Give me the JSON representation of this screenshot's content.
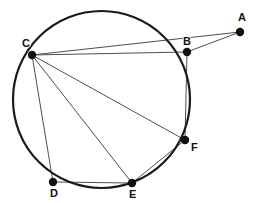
{
  "figure": {
    "width": 257,
    "height": 203,
    "background_color": "#ffffff",
    "stroke_color": "#3a3a3a",
    "circle_color": "#1a1a1a",
    "point_color": "#111111",
    "label_color": "#111111"
  },
  "circle": {
    "name": "main-circle",
    "cx": 101.5,
    "cy": 99.5,
    "r": 88.5,
    "stroke_width": 2.2
  },
  "points": [
    {
      "id": "A",
      "label": "A",
      "x": 240,
      "y": 32,
      "label_x": 238,
      "label_y": 21,
      "on_circle": false,
      "radius": 4.2
    },
    {
      "id": "B",
      "label": "B",
      "x": 187,
      "y": 52,
      "label_x": 183,
      "label_y": 45,
      "on_circle": true,
      "radius": 4.2
    },
    {
      "id": "C",
      "label": "C",
      "x": 32,
      "y": 55,
      "label_x": 22,
      "label_y": 47,
      "on_circle": true,
      "radius": 4.2
    },
    {
      "id": "D",
      "label": "D",
      "x": 53,
      "y": 182,
      "label_x": 50,
      "label_y": 197,
      "on_circle": false,
      "radius": 4.2
    },
    {
      "id": "E",
      "label": "E",
      "x": 132,
      "y": 183,
      "label_x": 129,
      "label_y": 198,
      "on_circle": true,
      "radius": 4.2
    },
    {
      "id": "F",
      "label": "F",
      "x": 185,
      "y": 140,
      "label_x": 191,
      "label_y": 151,
      "on_circle": true,
      "radius": 4.2
    }
  ],
  "segments": [
    {
      "id": "CB",
      "from": "C",
      "to": "B",
      "stroke_width": 0.9
    },
    {
      "id": "CA",
      "from": "C",
      "to": "A",
      "stroke_width": 0.9
    },
    {
      "id": "BA",
      "from": "B",
      "to": "A",
      "stroke_width": 0.9
    },
    {
      "id": "BF",
      "from": "B",
      "to": "F",
      "stroke_width": 0.9
    },
    {
      "id": "CF",
      "from": "C",
      "to": "F",
      "stroke_width": 0.9
    },
    {
      "id": "CE",
      "from": "C",
      "to": "E",
      "stroke_width": 0.9
    },
    {
      "id": "CD",
      "from": "C",
      "to": "D",
      "stroke_width": 0.9
    },
    {
      "id": "EF",
      "from": "E",
      "to": "F",
      "stroke_width": 0.9
    },
    {
      "id": "DE",
      "from": "D",
      "to": "E",
      "stroke_width": 0.9
    }
  ]
}
